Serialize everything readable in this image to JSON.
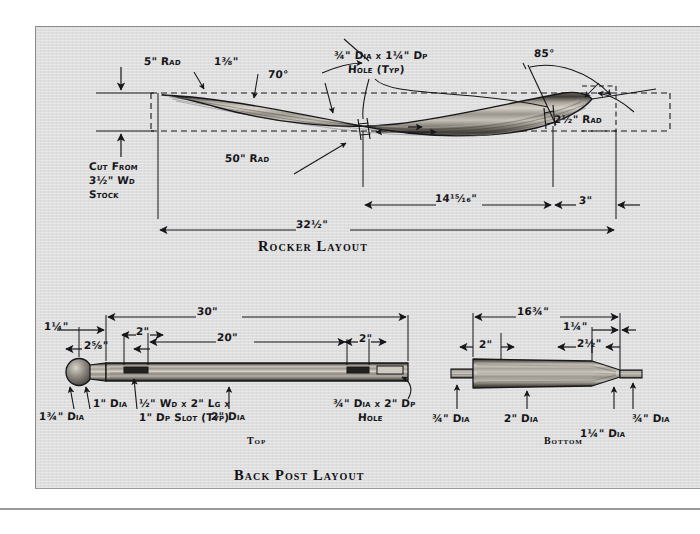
{
  "page": {
    "background": "#ffffff",
    "panel_background": "#dedede",
    "ink_color": "#16161a",
    "wood_light": "#c9c5bd",
    "wood_mid": "#8e8a82",
    "wood_dark": "#4a4842"
  },
  "sections": [
    {
      "id": "rocker",
      "caption": "Rocker Layout"
    },
    {
      "id": "back_post",
      "caption": "Back Post Layout"
    }
  ],
  "rocker": {
    "caption": "Rocker Layout",
    "labels": {
      "rad_5": "5\" Rad",
      "thickness": "1⅜\"",
      "angle_70": "70°",
      "hole_typ_l1": "¾\" Dia x 1¼\" Dp",
      "hole_typ_l2": "Hole (Typ)",
      "angle_85": "85°",
      "rad_2_5": "2½\" Rad",
      "rad_50": "50\" Rad",
      "stock_l1": "Cut From",
      "stock_l2": "3½\" Wd",
      "stock_l3": "Stock",
      "dim_14_15_16": "14¹⁵⁄₁₆\"",
      "dim_3": "3\"",
      "dim_32_5": "32½\""
    }
  },
  "back_post": {
    "caption": "Back Post Layout",
    "top_view": {
      "caption": "Top",
      "labels": {
        "dim_30": "30\"",
        "dim_20": "20\"",
        "dim_2_left": "2\"",
        "dim_2_right": "2\"",
        "dim_1_25": "1¼\"",
        "dim_2_625": "2⅝\"",
        "dia_1_75": "1¾\" Dia",
        "dia_1": "1\" Dia",
        "slot_l1": "½\" Wd x 2\" Lg x",
        "slot_l2": "1\" Dp Slot (Typ)",
        "dia_2": "2\" Dia",
        "hole_l1": "¾\" Dia x 2\" Dp",
        "hole_l2": "Hole"
      }
    },
    "bottom_view": {
      "caption": "Bottom",
      "labels": {
        "dim_16_75": "16¾\"",
        "dim_1_25": "1¼\"",
        "dim_2_5": "2½\"",
        "dim_2": "2\"",
        "dia_075_left": "¾\" Dia",
        "dia_2": "2\" Dia",
        "dia_1_25": "1¼\" Dia",
        "dia_075_right": "¾\" Dia"
      }
    }
  }
}
